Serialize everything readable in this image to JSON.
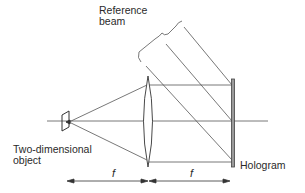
{
  "diagram": {
    "type": "optical-setup",
    "labels": {
      "reference_beam_line1": "Reference",
      "reference_beam_line2": "beam",
      "object_line1": "Two-dimensional",
      "object_line2": "object",
      "hologram": "Hologram",
      "focal_left": "f",
      "focal_right": "f"
    },
    "components": [
      {
        "name": "two-dimensional-object",
        "kind": "planar object"
      },
      {
        "name": "lens",
        "kind": "convex lens"
      },
      {
        "name": "hologram",
        "kind": "recording plate"
      },
      {
        "name": "reference-beam",
        "kind": "collimated oblique beam"
      }
    ],
    "dimensions": [
      {
        "label": "f",
        "from": "object",
        "to": "lens"
      },
      {
        "label": "f",
        "from": "lens",
        "to": "hologram"
      }
    ],
    "colors": {
      "line": "#555555",
      "text": "#2a2a2a",
      "background": "#ffffff"
    }
  }
}
